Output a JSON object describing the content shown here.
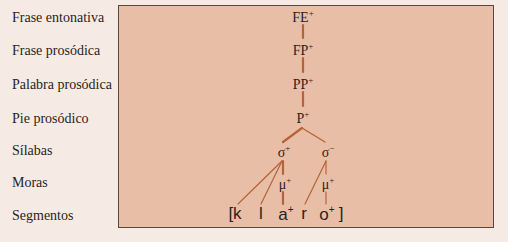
{
  "levels": [
    {
      "label": "Frase entonativa"
    },
    {
      "label": "Frase prosódica"
    },
    {
      "label": "Palabra prosódica"
    },
    {
      "label": "Pie prosódico"
    },
    {
      "label": "Sílabas"
    },
    {
      "label": "Moras"
    },
    {
      "label": "Segmentos"
    }
  ],
  "nodes": {
    "fe": {
      "base": "FE",
      "sup": "+"
    },
    "fp": {
      "base": "FP",
      "sup": "+"
    },
    "pp": {
      "base": "PP",
      "sup": "+"
    },
    "p": {
      "base": "P",
      "sup": "+"
    },
    "sigma1": {
      "base": "σ",
      "sup": "+"
    },
    "sigma2": {
      "base": "σ",
      "sup": "−"
    },
    "mu1": {
      "base": "μ",
      "sup": "+"
    },
    "mu2": {
      "base": "μ",
      "sup": "+"
    }
  },
  "segments": [
    {
      "text": "[k",
      "sup": ""
    },
    {
      "text": "l",
      "sup": ""
    },
    {
      "text": "a",
      "sup": "+"
    },
    {
      "text": "r",
      "sup": ""
    },
    {
      "text": "o",
      "sup": "+"
    },
    {
      "text": "]",
      "sup": ""
    }
  ],
  "colors": {
    "line": "#b4633a",
    "box_fill": "#e9bea6",
    "background": "#f6ebe4"
  }
}
